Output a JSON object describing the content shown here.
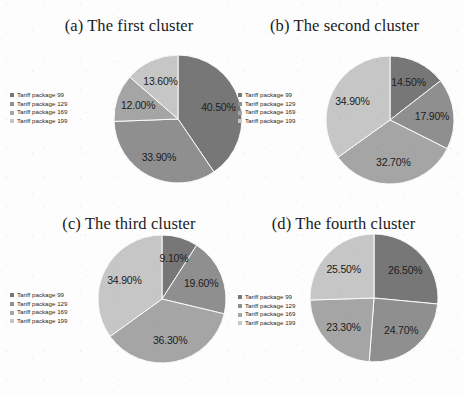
{
  "figure": {
    "background_color": "#fdfdfd",
    "palette": {
      "tariff_99": "#777777",
      "tariff_129": "#8f8f8f",
      "tariff_169": "#a5a5a5",
      "tariff_199": "#c6c6c6",
      "slice_border": "#fafafa"
    },
    "legend_items": [
      "Tariff package 99",
      "Tariff package 129",
      "Tariff package 169",
      "Tariff package 199"
    ]
  },
  "panels": [
    {
      "id": "a",
      "title": "(a) The first cluster"
    },
    {
      "id": "b",
      "title": "(b) The second cluster"
    },
    {
      "id": "c",
      "title": "(c) The third cluster"
    },
    {
      "id": "d",
      "title": "(d) The fourth cluster"
    }
  ],
  "chart_data": [
    {
      "type": "pie",
      "title": "(a) The first cluster",
      "categories": [
        "Tariff package 99",
        "Tariff package 129",
        "Tariff package 169",
        "Tariff package 199"
      ],
      "values": [
        40.5,
        33.9,
        12.0,
        13.6
      ],
      "labels": [
        "40.50%",
        "33.90%",
        "12.00%",
        "13.60%"
      ],
      "colors": [
        "#777777",
        "#8f8f8f",
        "#a5a5a5",
        "#c6c6c6"
      ],
      "start_angle_deg": 0,
      "direction": "clockwise",
      "legend_position": "left"
    },
    {
      "type": "pie",
      "title": "(b) The second cluster",
      "categories": [
        "Tariff package 99",
        "Tariff package 129",
        "Tariff package 169",
        "Tariff package 199"
      ],
      "values": [
        14.5,
        17.9,
        32.7,
        34.9
      ],
      "labels": [
        "14.50%",
        "17.90%",
        "32.70%",
        "34.90%"
      ],
      "colors": [
        "#777777",
        "#8f8f8f",
        "#a5a5a5",
        "#c6c6c6"
      ],
      "start_angle_deg": 0,
      "direction": "clockwise",
      "legend_position": "left"
    },
    {
      "type": "pie",
      "title": "(c) The third cluster",
      "categories": [
        "Tariff package 99",
        "Tariff package 129",
        "Tariff package 169",
        "Tariff package 199"
      ],
      "values": [
        9.1,
        19.6,
        36.3,
        34.9
      ],
      "labels": [
        "9.10%",
        "19.60%",
        "36.30%",
        "34.90%"
      ],
      "colors": [
        "#777777",
        "#8f8f8f",
        "#a5a5a5",
        "#c6c6c6"
      ],
      "start_angle_deg": 0,
      "direction": "clockwise",
      "legend_position": "left"
    },
    {
      "type": "pie",
      "title": "(d) The fourth cluster",
      "categories": [
        "Tariff package 99",
        "Tariff package 129",
        "Tariff package 169",
        "Tariff package 199"
      ],
      "values": [
        26.5,
        24.7,
        23.3,
        25.5
      ],
      "labels": [
        "26.50%",
        "24.70%",
        "23.30%",
        "25.50%"
      ],
      "colors": [
        "#777777",
        "#8f8f8f",
        "#a5a5a5",
        "#c6c6c6"
      ],
      "start_angle_deg": 0,
      "direction": "clockwise",
      "legend_position": "left"
    }
  ]
}
